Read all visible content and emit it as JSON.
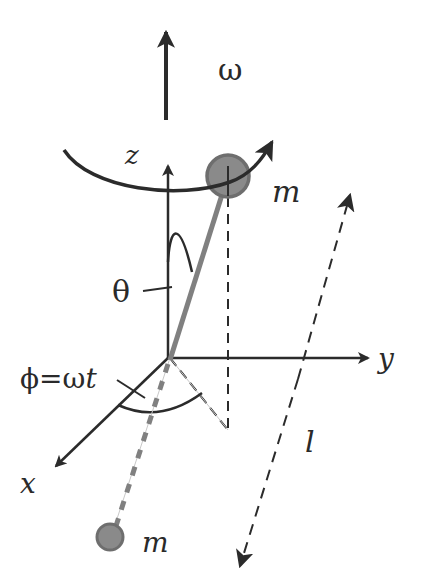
{
  "figure": {
    "labels": {
      "omega": "ω",
      "z_axis": "z",
      "y_axis": "y",
      "x_axis": "x",
      "theta": "θ",
      "phi": "ϕ=ω",
      "phi_t": "t",
      "length": "l",
      "mass_upper": "m",
      "mass_lower": "m"
    },
    "colors": {
      "line": "#2b2b2b",
      "rod": "#808080",
      "mass_fill": "#8a8a8a",
      "mass_stroke": "#6e6e6e",
      "guide": "#c8c8c8",
      "background": "#ffffff"
    },
    "elements": [
      {
        "id": "omega-arrow",
        "description": "angular velocity vector pointing up"
      },
      {
        "id": "rotation-arc",
        "description": "curved arrow indicating rotation about z"
      },
      {
        "id": "z-axis",
        "description": "vertical axis"
      },
      {
        "id": "y-axis",
        "description": "horizontal axis"
      },
      {
        "id": "x-axis",
        "description": "diagonal axis toward viewer"
      },
      {
        "id": "rod",
        "description": "rigid rod through origin at angle θ from z"
      },
      {
        "id": "upper-mass",
        "description": "mass m at upper end"
      },
      {
        "id": "lower-mass",
        "description": "mass m at lower end (behind, dashed rod)"
      },
      {
        "id": "theta-arc",
        "description": "angle θ between z axis and rod"
      },
      {
        "id": "phi-arc",
        "description": "azimuthal angle φ=ωt in xy plane"
      },
      {
        "id": "length-arrow",
        "description": "double dashed arrow indicating rod length l"
      }
    ]
  }
}
